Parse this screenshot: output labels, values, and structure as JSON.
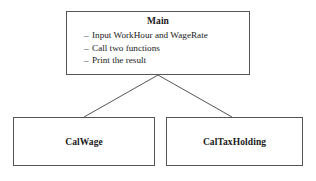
{
  "diagram": {
    "type": "hierarchy-tree",
    "background_color": "#ffffff",
    "line_color": "#555555",
    "text_color": "#1a1a1a",
    "root": {
      "title": "Main",
      "bullets": [
        {
          "dash": "–",
          "text": "Input WorkHour and WageRate"
        },
        {
          "dash": "–",
          "text": "Call two functions"
        },
        {
          "dash": "–",
          "text": "Print the result"
        }
      ]
    },
    "children": [
      {
        "title": "CalWage"
      },
      {
        "title": "CalTaxHolding"
      }
    ]
  }
}
